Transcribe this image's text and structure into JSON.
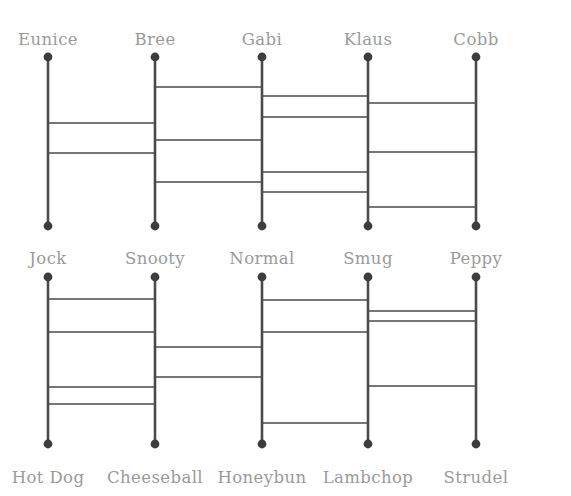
{
  "diagram": {
    "type": "amidakuji-ladder",
    "title": "",
    "background_color": "#ffffff",
    "line_color": "#4a4a4a",
    "dot_color": "#3d3d3d",
    "label_color": "#9a9a9a",
    "width": 571,
    "height": 496,
    "columns_x": [
      48,
      155,
      262,
      368,
      476
    ],
    "ladders": [
      {
        "id": "upper-ladder",
        "top_y": 57,
        "bottom_y": 226,
        "top_labels": [
          "Eunice",
          "Bree",
          "Gabi",
          "Klaus",
          "Cobb"
        ],
        "bottom_labels": [
          "Jock",
          "Snooty",
          "Normal",
          "Smug",
          "Peppy"
        ],
        "top_label_y": 32,
        "bottom_label_y": 251,
        "rungs": [
          {
            "from_col": 0,
            "to_col": 1,
            "y": 123
          },
          {
            "from_col": 0,
            "to_col": 1,
            "y": 153
          },
          {
            "from_col": 1,
            "to_col": 2,
            "y": 87
          },
          {
            "from_col": 1,
            "to_col": 2,
            "y": 140
          },
          {
            "from_col": 1,
            "to_col": 2,
            "y": 182
          },
          {
            "from_col": 2,
            "to_col": 3,
            "y": 96
          },
          {
            "from_col": 2,
            "to_col": 3,
            "y": 117
          },
          {
            "from_col": 2,
            "to_col": 3,
            "y": 172
          },
          {
            "from_col": 2,
            "to_col": 3,
            "y": 192
          },
          {
            "from_col": 3,
            "to_col": 4,
            "y": 103
          },
          {
            "from_col": 3,
            "to_col": 4,
            "y": 152
          },
          {
            "from_col": 3,
            "to_col": 4,
            "y": 207
          }
        ]
      },
      {
        "id": "lower-ladder",
        "top_y": 277,
        "bottom_y": 444,
        "top_labels": [
          "Jock",
          "Snooty",
          "Normal",
          "Smug",
          "Peppy"
        ],
        "bottom_labels": [
          "Hot Dog",
          "Cheeseball",
          "Honeybun",
          "Lambchop",
          "Strudel"
        ],
        "top_label_y": 251,
        "bottom_label_y": 470,
        "rungs": [
          {
            "from_col": 0,
            "to_col": 1,
            "y": 299
          },
          {
            "from_col": 0,
            "to_col": 1,
            "y": 332
          },
          {
            "from_col": 0,
            "to_col": 1,
            "y": 387
          },
          {
            "from_col": 0,
            "to_col": 1,
            "y": 404
          },
          {
            "from_col": 1,
            "to_col": 2,
            "y": 347
          },
          {
            "from_col": 1,
            "to_col": 2,
            "y": 377
          },
          {
            "from_col": 2,
            "to_col": 3,
            "y": 300
          },
          {
            "from_col": 2,
            "to_col": 3,
            "y": 332
          },
          {
            "from_col": 2,
            "to_col": 3,
            "y": 423
          },
          {
            "from_col": 3,
            "to_col": 4,
            "y": 311
          },
          {
            "from_col": 3,
            "to_col": 4,
            "y": 321
          },
          {
            "from_col": 3,
            "to_col": 4,
            "y": 386
          }
        ]
      }
    ]
  }
}
